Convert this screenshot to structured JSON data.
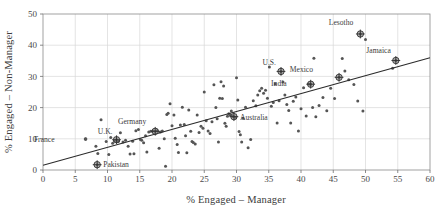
{
  "chart_data": {
    "type": "scatter",
    "title": "",
    "xlabel": "% Engaged – Manager",
    "ylabel": "% Engaged – Non-Manager",
    "xlim": [
      0,
      60
    ],
    "ylim": [
      0,
      50
    ],
    "xticks": [
      0,
      5,
      10,
      15,
      20,
      25,
      30,
      35,
      40,
      45,
      50,
      55,
      60
    ],
    "yticks": [
      0,
      10,
      20,
      30,
      40,
      50
    ],
    "xtick_labels": [
      "0",
      "5",
      "10",
      "15",
      "20",
      "25",
      "30",
      "35",
      "40",
      "45",
      "50",
      "55",
      "60"
    ],
    "ytick_labels": [
      "0",
      "10",
      "20",
      "30",
      "40",
      "50"
    ],
    "grid": true,
    "legend": "none",
    "point_color": "#555555",
    "trendline": {
      "type": "linear-fit",
      "x_start": 0,
      "y_start": 1.5,
      "x_end": 60,
      "y_end": 36.0,
      "slope": 0.575,
      "intercept": 1.5,
      "color": "#2b2b2b"
    },
    "annotated_points": [
      {
        "label": "France",
        "x": 6.6,
        "y": 9.9,
        "label_dx": -31,
        "label_dy": 2.6,
        "highlight": false
      },
      {
        "label": "Pakistan",
        "x": 8.4,
        "y": 1.7,
        "label_dx": 6,
        "label_dy": 2.6,
        "highlight": true
      },
      {
        "label": "U.K.",
        "x": 11.4,
        "y": 9.7,
        "label_dx": -4,
        "label_dy": -5.5,
        "highlight": true
      },
      {
        "label": "Germany",
        "x": 17.4,
        "y": 12.4,
        "label_dx": -9,
        "label_dy": -7.0,
        "highlight": true
      },
      {
        "label": "Australia",
        "x": 29.6,
        "y": 17.1,
        "label_dx": 6,
        "label_dy": 3.0,
        "highlight": true
      },
      {
        "label": "U.S.",
        "x": 36.9,
        "y": 31.6,
        "label_dx": -5,
        "label_dy": -6.5,
        "highlight": true
      },
      {
        "label": "India",
        "x": 41.5,
        "y": 27.5,
        "label_dx": -24,
        "label_dy": 1.5,
        "highlight": true
      },
      {
        "label": "Mexico",
        "x": 45.9,
        "y": 29.7,
        "label_dx": -26,
        "label_dy": -5.0,
        "highlight": true
      },
      {
        "label": "Lesotho",
        "x": 49.2,
        "y": 43.6,
        "label_dx": -7,
        "label_dy": -8.5,
        "highlight": true
      },
      {
        "label": "Jamaica",
        "x": 54.7,
        "y": 35.1,
        "label_dx": -5,
        "label_dy": -7.5,
        "highlight": true
      }
    ],
    "points": [
      [
        6.6,
        9.9
      ],
      [
        8.2,
        7.6
      ],
      [
        8.4,
        1.7
      ],
      [
        8.5,
        5.3
      ],
      [
        9.0,
        16.1
      ],
      [
        9.8,
        9.1
      ],
      [
        10.2,
        5.0
      ],
      [
        10.5,
        10.4
      ],
      [
        10.8,
        8.6
      ],
      [
        11.1,
        9.4
      ],
      [
        11.4,
        9.7
      ],
      [
        11.7,
        9.2
      ],
      [
        12.0,
        11.9
      ],
      [
        12.4,
        9.0
      ],
      [
        12.8,
        9.5
      ],
      [
        13.2,
        7.6
      ],
      [
        13.5,
        5.1
      ],
      [
        13.9,
        9.2
      ],
      [
        14.1,
        5.2
      ],
      [
        14.4,
        12.6
      ],
      [
        14.8,
        13.0
      ],
      [
        15.1,
        9.8
      ],
      [
        15.3,
        9.5
      ],
      [
        15.6,
        8.7
      ],
      [
        15.9,
        11.0
      ],
      [
        16.1,
        5.8
      ],
      [
        16.4,
        12.2
      ],
      [
        16.7,
        12.4
      ],
      [
        17.0,
        12.5
      ],
      [
        17.4,
        12.4
      ],
      [
        17.7,
        12.6
      ],
      [
        18.0,
        7.0
      ],
      [
        18.2,
        12.2
      ],
      [
        18.5,
        12.5
      ],
      [
        18.8,
        10.0
      ],
      [
        19.0,
        1.2
      ],
      [
        19.2,
        17.8
      ],
      [
        19.4,
        18.2
      ],
      [
        19.7,
        21.2
      ],
      [
        20.0,
        14.2
      ],
      [
        20.3,
        17.6
      ],
      [
        20.5,
        10.2
      ],
      [
        20.8,
        8.2
      ],
      [
        21.0,
        5.6
      ],
      [
        21.3,
        14.4
      ],
      [
        21.6,
        20.1
      ],
      [
        21.9,
        14.6
      ],
      [
        22.1,
        11.0
      ],
      [
        22.3,
        5.5
      ],
      [
        22.6,
        19.2
      ],
      [
        22.9,
        12.4
      ],
      [
        23.1,
        9.1
      ],
      [
        23.3,
        8.8
      ],
      [
        23.6,
        8.3
      ],
      [
        23.9,
        17.6
      ],
      [
        24.2,
        12.0
      ],
      [
        24.5,
        14.0
      ],
      [
        24.8,
        13.4
      ],
      [
        25.0,
        25.0
      ],
      [
        25.3,
        15.8
      ],
      [
        25.6,
        12.5
      ],
      [
        25.9,
        11.7
      ],
      [
        26.2,
        15.5
      ],
      [
        26.5,
        27.3
      ],
      [
        26.8,
        20.0
      ],
      [
        27.0,
        16.4
      ],
      [
        27.2,
        9.0
      ],
      [
        27.4,
        23.0
      ],
      [
        27.6,
        28.3
      ],
      [
        27.8,
        22.9
      ],
      [
        28.0,
        26.9
      ],
      [
        28.2,
        15.0
      ],
      [
        28.4,
        14.0
      ],
      [
        28.6,
        17.2
      ],
      [
        28.8,
        18.0
      ],
      [
        29.0,
        17.6
      ],
      [
        29.2,
        18.9
      ],
      [
        29.4,
        17.2
      ],
      [
        29.6,
        17.1
      ],
      [
        29.8,
        16.9
      ],
      [
        30.0,
        29.6
      ],
      [
        30.2,
        22.4
      ],
      [
        30.4,
        12.3
      ],
      [
        30.6,
        11.3
      ],
      [
        30.8,
        9.0
      ],
      [
        31.0,
        16.6
      ],
      [
        31.4,
        20.1
      ],
      [
        31.8,
        7.1
      ],
      [
        32.2,
        9.8
      ],
      [
        32.6,
        22.2
      ],
      [
        33.0,
        20.6
      ],
      [
        33.3,
        24.0
      ],
      [
        33.6,
        25.4
      ],
      [
        33.9,
        26.2
      ],
      [
        34.2,
        24.6
      ],
      [
        34.5,
        25.6
      ],
      [
        34.8,
        23.0
      ],
      [
        35.1,
        33.0
      ],
      [
        35.4,
        20.4
      ],
      [
        35.7,
        21.6
      ],
      [
        36.0,
        27.6
      ],
      [
        36.3,
        15.1
      ],
      [
        36.6,
        22.2
      ],
      [
        36.9,
        31.6
      ],
      [
        37.2,
        28.2
      ],
      [
        37.5,
        24.0
      ],
      [
        37.8,
        21.0
      ],
      [
        38.1,
        19.1
      ],
      [
        38.4,
        15.1
      ],
      [
        38.8,
        22.0
      ],
      [
        39.2,
        23.4
      ],
      [
        39.6,
        12.5
      ],
      [
        40.0,
        19.6
      ],
      [
        40.4,
        26.4
      ],
      [
        40.8,
        17.3
      ],
      [
        41.2,
        27.6
      ],
      [
        41.5,
        27.5
      ],
      [
        41.8,
        20.0
      ],
      [
        42.0,
        35.8
      ],
      [
        42.3,
        17.1
      ],
      [
        42.8,
        20.7
      ],
      [
        43.4,
        23.2
      ],
      [
        44.0,
        19.0
      ],
      [
        44.6,
        26.2
      ],
      [
        45.2,
        22.9
      ],
      [
        45.9,
        29.7
      ],
      [
        46.4,
        35.7
      ],
      [
        46.8,
        31.7
      ],
      [
        47.4,
        28.9
      ],
      [
        48.2,
        27.4
      ],
      [
        48.8,
        22.1
      ],
      [
        49.2,
        43.6
      ],
      [
        49.6,
        18.9
      ],
      [
        50.0,
        41.8
      ],
      [
        54.2,
        32.6
      ],
      [
        54.7,
        35.1
      ]
    ]
  },
  "figure": {
    "plot_area": {
      "left": 43,
      "top": 14,
      "right": 430,
      "bottom": 170
    }
  }
}
